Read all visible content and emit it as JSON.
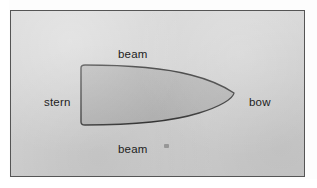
{
  "diagram": {
    "frame": {
      "border_color": "#555555",
      "background_color": "#d4d4d4"
    },
    "shape": {
      "name": "hull-outline",
      "fill_color": "#b5b5b5",
      "stroke_color": "#2b2b2b",
      "description": "flat stern at left, curved beam sides, pointed bow at right"
    },
    "labels": [
      {
        "id": "beam-top",
        "text": "beam",
        "position": "top"
      },
      {
        "id": "stern",
        "text": "stern",
        "position": "left"
      },
      {
        "id": "bow",
        "text": "bow",
        "position": "right"
      },
      {
        "id": "beam-bottom",
        "text": "beam",
        "position": "bottom"
      }
    ]
  }
}
